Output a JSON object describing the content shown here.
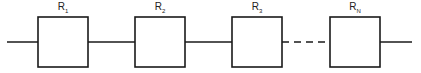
{
  "diagram": {
    "type": "series reliability block diagram",
    "blocks": [
      {
        "label": "R",
        "subscript": "1"
      },
      {
        "label": "R",
        "subscript": "2"
      },
      {
        "label": "R",
        "subscript": "3"
      },
      {
        "label": "R",
        "subscript": "N"
      }
    ],
    "connectors": [
      "solid",
      "solid",
      "dashed"
    ],
    "colors": {
      "stroke": "#1a1a1a",
      "background": "#ffffff"
    }
  }
}
